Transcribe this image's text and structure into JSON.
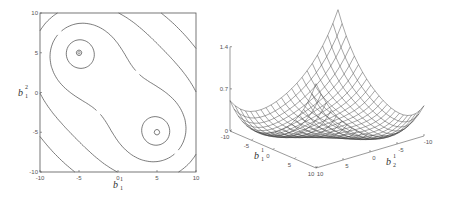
{
  "chart_data": [
    {
      "type": "contour",
      "title": "",
      "xlabel": "b_1^1",
      "ylabel": "b_1^2",
      "xlim": [
        -10,
        10
      ],
      "ylim": [
        -10,
        10
      ],
      "xticks": [
        "-10",
        "-5",
        "0",
        "5",
        "10"
      ],
      "yticks": [
        "-10",
        "-5",
        "0",
        "5",
        "10"
      ],
      "grid": false,
      "minima": [
        [
          -5,
          5
        ],
        [
          5,
          -5
        ]
      ],
      "levels": [
        0.02,
        0.1,
        0.25,
        0.45,
        0.7
      ]
    },
    {
      "type": "surface",
      "title": "",
      "xlabel": "b_1^1",
      "ylabel": "b_2^1",
      "zlabel": "",
      "xlim": [
        -10,
        10
      ],
      "ylim": [
        -10,
        10
      ],
      "zlim": [
        0,
        1.4
      ],
      "xticks": [
        "-10",
        "-5",
        "0",
        "5",
        "10"
      ],
      "yticks": [
        "10",
        "5",
        "0",
        "-5",
        "-10"
      ],
      "zticks": [
        "0",
        "0.7",
        "1.4"
      ],
      "grid_resolution": 21,
      "peak": {
        "x": -10,
        "y": -10,
        "z": 1.4
      },
      "minima": [
        [
          -5,
          5
        ],
        [
          5,
          -5
        ]
      ]
    }
  ],
  "labels": {
    "contour_x_main": "b",
    "contour_x_sup": "1",
    "contour_x_sub": "1",
    "contour_y_main": "b",
    "contour_y_sup": "2",
    "contour_y_sub": "1",
    "surface_x_main": "b",
    "surface_x_sup": "1",
    "surface_x_sub": "1",
    "surface_y_main": "b",
    "surface_y_sup": "1",
    "surface_y_sub": "2"
  },
  "colors": {
    "line": "#444444",
    "axis": "#555555",
    "mesh": "#3a3a3a",
    "background": "#ffffff"
  }
}
